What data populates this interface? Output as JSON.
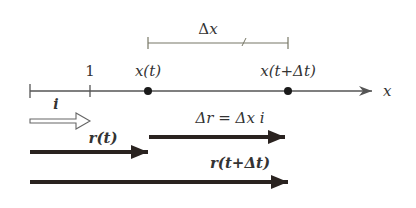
{
  "diagram": {
    "axis": {
      "label": "x",
      "tick_label": "1"
    },
    "points": {
      "p1": {
        "label": "x(t)"
      },
      "p2": {
        "label": "x(t+Δt)"
      }
    },
    "interval": {
      "label": "Δx"
    },
    "vectors": {
      "unit": {
        "label": "i"
      },
      "r_t": {
        "label": "r(t)"
      },
      "delta_r": {
        "label": "Δr = Δx i"
      },
      "r_t_dt": {
        "label": "r(t+Δt)"
      }
    },
    "colors": {
      "axis": "#555555",
      "bracket": "#777766",
      "vector": "#2a2320",
      "unit_vector_outline": "#666666",
      "text": "#333333"
    }
  }
}
